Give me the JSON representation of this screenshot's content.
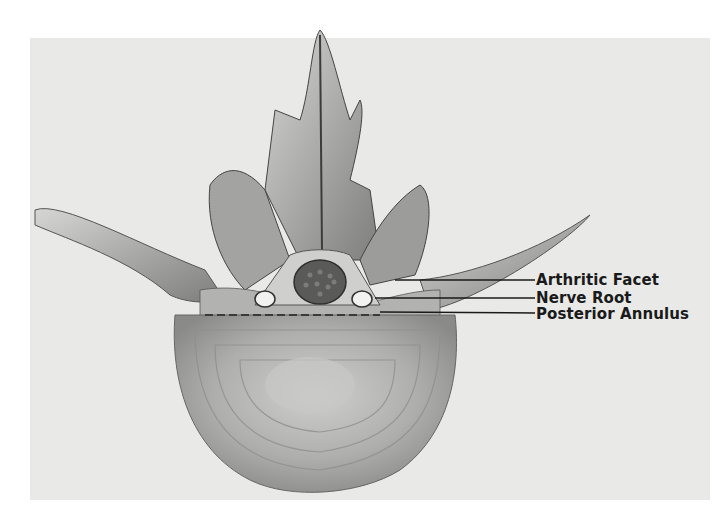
{
  "diagram": {
    "colors": {
      "background": "#e9e9e7",
      "bone": "#b8b8b6",
      "bone_dark": "#6e6e6c",
      "disc": "#a9a9a7",
      "canal": "#5a5a58",
      "label": "#1a1a1a"
    },
    "labels": [
      {
        "id": "arthritic-facet",
        "text": "Arthritic Facet"
      },
      {
        "id": "nerve-root",
        "text": "Nerve Root"
      },
      {
        "id": "posterior-annulus",
        "text": "Posterior Annulus"
      }
    ]
  }
}
